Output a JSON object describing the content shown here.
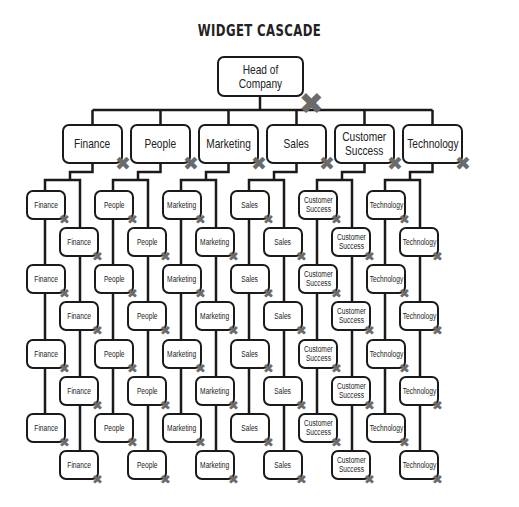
{
  "title": "WIDGET CASCADE",
  "head": {
    "label": "Head of Company",
    "remove_icon": "close-x-icon"
  },
  "departments": [
    {
      "label": "Finance",
      "children": [
        "Finance",
        "Finance",
        "Finance",
        "Finance",
        "Finance",
        "Finance",
        "Finance",
        "Finance"
      ]
    },
    {
      "label": "People",
      "children": [
        "People",
        "People",
        "People",
        "People",
        "People",
        "People",
        "People",
        "People"
      ]
    },
    {
      "label": "Marketing",
      "children": [
        "Marketing",
        "Marketing",
        "Marketing",
        "Marketing",
        "Marketing",
        "Marketing",
        "Marketing",
        "Marketing"
      ]
    },
    {
      "label": "Sales",
      "children": [
        "Sales",
        "Sales",
        "Sales",
        "Sales",
        "Sales",
        "Sales",
        "Sales",
        "Sales"
      ]
    },
    {
      "label": "Customer\nSuccess",
      "children": [
        "Customer\nSuccess",
        "Customer\nSuccess",
        "Customer\nSuccess",
        "Customer\nSuccess",
        "Customer\nSuccess",
        "Customer\nSuccess",
        "Customer\nSuccess",
        "Customer\nSuccess"
      ]
    },
    {
      "label": "Technology",
      "children": [
        "Technology",
        "Technology",
        "Technology",
        "Technology",
        "Technology",
        "Technology",
        "Technology",
        "Technology"
      ]
    }
  ],
  "remove_glyph": "✖",
  "colors": {
    "line": "#1a1a1a",
    "remove_icon": "#6b6b6b",
    "background": "#ffffff"
  }
}
